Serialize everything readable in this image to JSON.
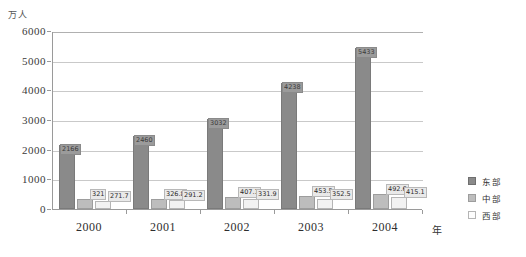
{
  "chart_data": {
    "type": "bar",
    "title": "",
    "xlabel": "年",
    "ylabel": "万人",
    "categories": [
      "2000",
      "2001",
      "2002",
      "2003",
      "2004"
    ],
    "ylim": [
      0,
      6000
    ],
    "yticks": [
      "0",
      "1000",
      "2000",
      "3000",
      "4000",
      "5000",
      "6000"
    ],
    "grid": true,
    "legend_position": "right",
    "series": [
      {
        "name": "东部",
        "color": "#8a8a8a",
        "values": [
          2166,
          2460,
          3032,
          4238,
          5433
        ],
        "labels": [
          "2166",
          "2460",
          "3032",
          "4238",
          "5433"
        ]
      },
      {
        "name": "中部",
        "color": "#bdbdbd",
        "values": [
          321,
          326.8,
          407.1,
          453.5,
          492.6
        ],
        "labels": [
          "321",
          "326.8",
          "407.1",
          "453.5",
          "492.6"
        ]
      },
      {
        "name": "西部",
        "color": "#f2f2f2",
        "values": [
          271.7,
          291.2,
          331.9,
          352.5,
          415.1
        ],
        "labels": [
          "271.7",
          "291.2",
          "331.9",
          "352.5",
          "415.1"
        ]
      }
    ]
  },
  "axis": {
    "y_unit": "万人",
    "x_unit": "年"
  },
  "legend": {
    "items": [
      {
        "label": "东部"
      },
      {
        "label": "中部"
      },
      {
        "label": "西部"
      }
    ]
  }
}
